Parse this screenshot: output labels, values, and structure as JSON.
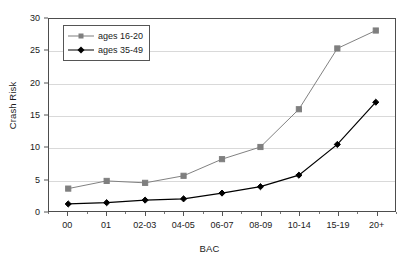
{
  "chart_data": {
    "type": "line",
    "title": "",
    "xlabel": "BAC",
    "ylabel": "Crash Risk",
    "categories": [
      "00",
      "01",
      "02-03",
      "04-05",
      "06-07",
      "08-09",
      "10-14",
      "15-19",
      "20+"
    ],
    "ylim": [
      0,
      30
    ],
    "yticks": [
      0,
      5,
      10,
      15,
      20,
      25,
      30
    ],
    "grid": true,
    "legend_position": "upper-left-inside",
    "series": [
      {
        "name": "ages 16-20",
        "color": "#7f7f7f",
        "marker": "square",
        "values": [
          3.5,
          4.7,
          4.4,
          5.5,
          8.1,
          10.0,
          15.9,
          25.4,
          28.2
        ]
      },
      {
        "name": "ages 35-49",
        "color": "#000000",
        "marker": "diamond",
        "values": [
          1.1,
          1.3,
          1.7,
          1.9,
          2.8,
          3.8,
          5.6,
          10.4,
          17.0
        ]
      }
    ]
  }
}
